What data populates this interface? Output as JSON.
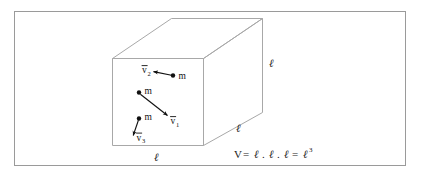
{
  "figure": {
    "kind": "physics-diagram",
    "border_color": "#9a9a9a",
    "cube_line_color": "#a8a8a8",
    "ink_color": "#111111",
    "background": "#ffffff"
  },
  "cube": {
    "edge_labels": [
      {
        "id": "right-vertical",
        "text": "ℓ"
      },
      {
        "id": "bottom-depth",
        "text": "ℓ"
      },
      {
        "id": "bottom-front",
        "text": "ℓ"
      }
    ]
  },
  "particles": [
    {
      "id": "particle-2",
      "mass_label": "m",
      "vector_label": "v",
      "vector_subscript": "2",
      "direction": "left-and-slightly-up"
    },
    {
      "id": "particle-1",
      "mass_label": "m",
      "vector_label": "v",
      "vector_subscript": "1",
      "direction": "down-right"
    },
    {
      "id": "particle-3",
      "mass_label": "m",
      "vector_label": "v",
      "vector_subscript": "3",
      "direction": "down-and-slightly-left"
    }
  ],
  "equation": {
    "lhs": "V",
    "eq1": "=",
    "term1": "ℓ",
    "dot1": ".",
    "term2": "ℓ",
    "dot2": ".",
    "term3": "ℓ",
    "eq2": "=",
    "rhs_base": "ℓ",
    "rhs_exponent": "3",
    "full_text": "V = ℓ . ℓ . ℓ = ℓ³"
  }
}
